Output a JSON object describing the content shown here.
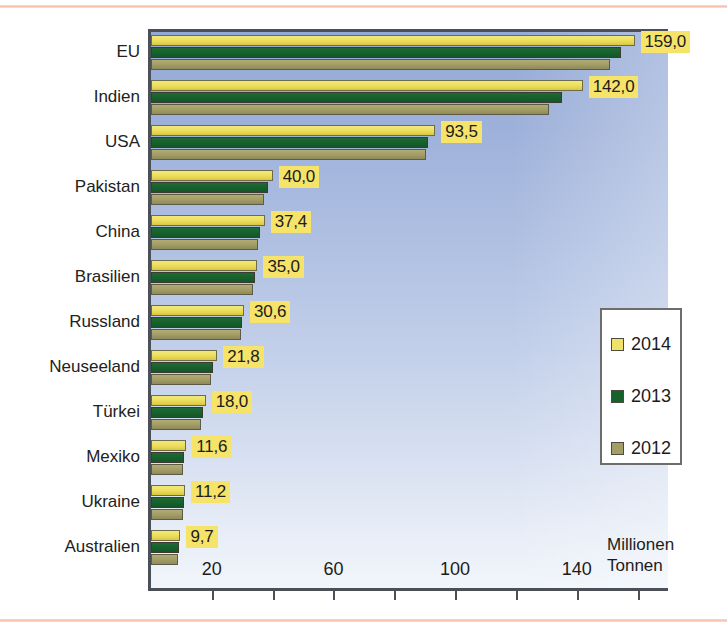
{
  "chart_data": {
    "type": "bar",
    "orientation": "horizontal",
    "title": "",
    "xlabel": "Millionen Tonnen",
    "ylabel": "",
    "xlim": [
      0,
      170
    ],
    "grid": false,
    "legend_position": "right",
    "axis_unit_line1": "Millionen",
    "axis_unit_line2": "Tonnen",
    "x_ticks_major": [
      20,
      60,
      100,
      140
    ],
    "x_ticks_major_labels": [
      "20",
      "60",
      "100",
      "140"
    ],
    "x_ticks_minor": [
      40,
      80,
      120,
      160
    ],
    "categories": [
      "EU",
      "Indien",
      "USA",
      "Pakistan",
      "China",
      "Brasilien",
      "Russland",
      "Neuseeland",
      "Türkei",
      "Mexiko",
      "Ukraine",
      "Australien"
    ],
    "series": [
      {
        "name": "2014",
        "color": "#efe268",
        "values": [
          159.0,
          142.0,
          93.5,
          40.0,
          37.4,
          35.0,
          30.6,
          21.8,
          18.0,
          11.6,
          11.2,
          9.7
        ],
        "labels": [
          "159,0",
          "142,0",
          "93,5",
          "40,0",
          "37,4",
          "35,0",
          "30,6",
          "21,8",
          "18,0",
          "11,6",
          "11,2",
          "9,7"
        ]
      },
      {
        "name": "2013",
        "color": "#17612c",
        "values": [
          154.5,
          135.0,
          91.0,
          38.5,
          36.0,
          34.2,
          30.0,
          20.5,
          17.2,
          11.0,
          10.8,
          9.3
        ]
      },
      {
        "name": "2012",
        "color": "#a39d66",
        "values": [
          151.0,
          131.0,
          90.5,
          37.0,
          35.2,
          33.5,
          29.5,
          19.8,
          16.5,
          10.6,
          10.4,
          9.0
        ]
      }
    ]
  },
  "legend": {
    "items": [
      {
        "label": "2014",
        "color": "#efe268"
      },
      {
        "label": "2013",
        "color": "#17612c"
      },
      {
        "label": "2012",
        "color": "#a39d66"
      }
    ]
  }
}
